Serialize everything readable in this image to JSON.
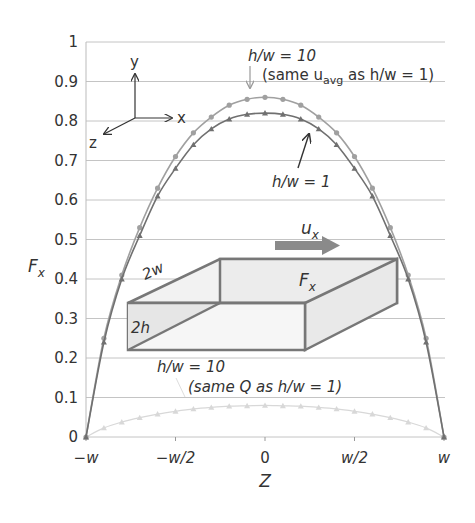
{
  "chart_data": {
    "type": "line",
    "title": "",
    "xlabel": "Z",
    "ylabel": "F_x",
    "ylim": [
      0,
      1
    ],
    "xlim": [
      -1,
      1
    ],
    "grid": true,
    "yticks": [
      "0",
      "0.1",
      "0.2",
      "0.3",
      "0.4",
      "0.5",
      "0.6",
      "0.7",
      "0.8",
      "0.9",
      "1"
    ],
    "xticks": [
      "-w",
      "-w/2",
      "0",
      "w/2",
      "w"
    ],
    "x": [
      -1,
      -0.9,
      -0.8,
      -0.7,
      -0.6,
      -0.5,
      -0.4,
      -0.3,
      -0.2,
      -0.1,
      0,
      0.1,
      0.2,
      0.3,
      0.4,
      0.5,
      0.6,
      0.7,
      0.8,
      0.9,
      1
    ],
    "series": [
      {
        "name": "h/w = 10 (same u_avg as h/w = 1)",
        "color": "#a0a0a0",
        "marker": "circle",
        "values": [
          0,
          0.25,
          0.41,
          0.53,
          0.63,
          0.71,
          0.77,
          0.81,
          0.84,
          0.855,
          0.86,
          0.855,
          0.84,
          0.81,
          0.77,
          0.71,
          0.63,
          0.53,
          0.41,
          0.25,
          0
        ]
      },
      {
        "name": "h/w = 1",
        "color": "#707070",
        "marker": "triangle",
        "values": [
          0,
          0.24,
          0.4,
          0.51,
          0.61,
          0.68,
          0.74,
          0.78,
          0.805,
          0.817,
          0.82,
          0.817,
          0.805,
          0.78,
          0.74,
          0.68,
          0.61,
          0.51,
          0.4,
          0.24,
          0
        ]
      },
      {
        "name": "h/w = 10 (same Q as h/w = 1)",
        "color": "#d8d8d8",
        "marker": "triangle",
        "values": [
          0,
          0.023,
          0.038,
          0.049,
          0.058,
          0.065,
          0.071,
          0.075,
          0.078,
          0.079,
          0.08,
          0.079,
          0.078,
          0.075,
          0.071,
          0.065,
          0.058,
          0.049,
          0.038,
          0.023,
          0
        ]
      }
    ],
    "annotations": [
      {
        "text": "h/w = 10",
        "note": "arrow to upper curve"
      },
      {
        "text": "(same u_avg as h/w = 1)"
      },
      {
        "text": "h/w = 1",
        "note": "arrow to middle curve"
      },
      {
        "text": "h/w = 10"
      },
      {
        "text": "(same Q as h/w = 1)"
      }
    ]
  },
  "labels": {
    "ylabel_main": "F",
    "ylabel_sub": "x",
    "xlabel": "Z",
    "ann1_line1": "h/w = 10",
    "ann1_line2_a": "(same u",
    "ann1_line2_sub": "avg",
    "ann1_line2_b": " as h/w = 1)",
    "ann2": "h/w = 1",
    "ann3_line1": "h/w = 10",
    "ann3_line2": "(same Q as h/w = 1)",
    "axes_y": "y",
    "axes_x": "x",
    "axes_z": "z",
    "box_width": "2w",
    "box_height": "2h",
    "box_force_main": "F",
    "box_force_sub": "x",
    "flow_main": "u",
    "flow_sub": "x"
  }
}
